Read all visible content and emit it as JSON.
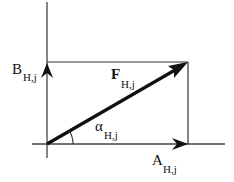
{
  "diagram": {
    "type": "vector-decomposition",
    "colors": {
      "stroke": "#111111",
      "background": "#ffffff"
    },
    "vectors": [
      {
        "name": "F",
        "subscript": "H,j",
        "bold": true,
        "from": [
          47,
          144
        ],
        "to": [
          188,
          62
        ],
        "role": "resultant"
      },
      {
        "name": "A",
        "subscript": "H,j",
        "bold": false,
        "from": [
          47,
          144
        ],
        "to": [
          188,
          144
        ],
        "role": "horizontal-component"
      },
      {
        "name": "B",
        "subscript": "H,j",
        "bold": false,
        "from": [
          47,
          144
        ],
        "to": [
          47,
          62
        ],
        "role": "vertical-component"
      }
    ],
    "angle": {
      "symbol": "α",
      "subscript": "H,j",
      "between": [
        "A",
        "F"
      ]
    },
    "labels": {
      "B": {
        "main": "B",
        "sub": "H,j"
      },
      "F": {
        "main": "F",
        "sub": "H,j"
      },
      "alpha": {
        "main": "α",
        "sub": "H,j"
      },
      "A": {
        "main": "A",
        "sub": "H,j"
      }
    }
  }
}
